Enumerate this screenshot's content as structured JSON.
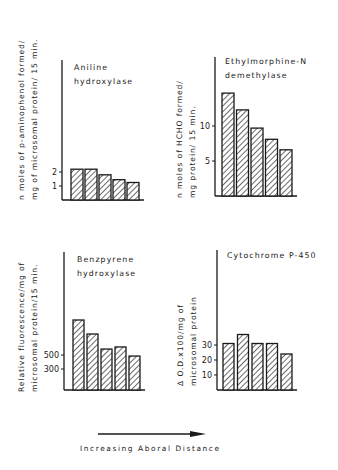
{
  "figure": {
    "x_direction_label": "Increasing Aboral Distance"
  },
  "chart_data": [
    {
      "type": "bar",
      "title": "Aniline hydroxylase",
      "title_lines": [
        "Aniline",
        "hydroxylase"
      ],
      "ylabel": "n moles of p-aminophenol formed/ mg of microsomal protein/ 15 min.",
      "ylabel_lines": [
        "n moles of p-aminophenol formed/",
        "mg of microsomal protein/ 15 min."
      ],
      "xlabel": "Increasing Aboral Distance",
      "categories": [
        "1",
        "2",
        "3",
        "4",
        "5"
      ],
      "values": [
        2.2,
        2.2,
        1.8,
        1.45,
        1.25
      ],
      "yticks": [
        1,
        2
      ],
      "ylim": [
        0,
        10
      ],
      "grid": false,
      "hatch": "diagonal",
      "layout": {
        "axis_x": 62,
        "axis_top": 60,
        "baseline": 200,
        "px_per_unit": 14,
        "bar_x0": 71,
        "bar_w": 12,
        "bar_gap": 14
      }
    },
    {
      "type": "bar",
      "title": "Ethylmorphine-N demethylase",
      "title_lines": [
        "Ethylmorphine-N",
        "demethylase"
      ],
      "ylabel": "n moles of HCHO formed/ mg protein/ 15 min.",
      "ylabel_lines": [
        "n moles of HCHO formed/",
        "mg protein/ 15 min."
      ],
      "xlabel": "Increasing Aboral Distance",
      "categories": [
        "1",
        "2",
        "3",
        "4",
        "5"
      ],
      "values": [
        14.7,
        12.3,
        9.7,
        8.1,
        6.6
      ],
      "yticks": [
        5,
        10
      ],
      "ylim": [
        0,
        20
      ],
      "grid": false,
      "hatch": "diagonal",
      "layout": {
        "axis_x": 215,
        "axis_top": 57,
        "baseline": 196,
        "px_per_unit": 7,
        "bar_x0": 222,
        "bar_w": 12,
        "bar_gap": 14.5
      }
    },
    {
      "type": "bar",
      "title": "Benzpyrene hydroxylase",
      "title_lines": [
        "Benzpyrene",
        "hydroxylase"
      ],
      "ylabel": "Relative fluorescence/mg of microsomal protein/15 min.",
      "ylabel_lines": [
        "Relative fluorescence/mg of",
        "microsomal protein/15 min."
      ],
      "xlabel": "Increasing Aboral Distance",
      "categories": [
        "1",
        "2",
        "3",
        "4",
        "5"
      ],
      "values": [
        1000,
        800,
        585,
        615,
        485
      ],
      "yticks": [
        300,
        500
      ],
      "ylim": [
        0,
        2000
      ],
      "grid": false,
      "hatch": "diagonal",
      "layout": {
        "axis_x": 64,
        "axis_top": 252,
        "baseline": 390,
        "px_per_unit": 0.07,
        "bar_x0": 73,
        "bar_w": 11,
        "bar_gap": 14
      }
    },
    {
      "type": "bar",
      "title": "Cytochrome P-450",
      "title_lines": [
        "Cytochrome P-450"
      ],
      "ylabel": "Δ O.D.x100/mg of microsomal protein",
      "ylabel_lines": [
        "Δ O.D.x100/mg of",
        "microsomal    protein"
      ],
      "xlabel": "Increasing Aboral Distance",
      "categories": [
        "1",
        "2",
        "3",
        "4",
        "5"
      ],
      "values": [
        31,
        37,
        31,
        31,
        24
      ],
      "yticks": [
        10,
        20,
        30
      ],
      "ylim": [
        0,
        90
      ],
      "grid": false,
      "hatch": "diagonal",
      "layout": {
        "axis_x": 217,
        "axis_top": 250,
        "baseline": 390,
        "px_per_unit": 1.5,
        "bar_x0": 223,
        "bar_w": 11,
        "bar_gap": 14.5
      }
    }
  ]
}
